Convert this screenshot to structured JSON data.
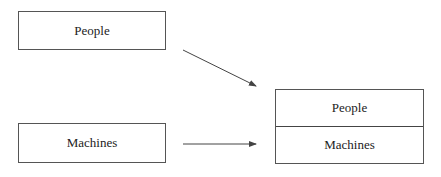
{
  "left_boxes": {
    "people": "People",
    "machines": "Machines"
  },
  "combined_box": {
    "top": "People",
    "bottom": "Machines"
  },
  "colors": {
    "line": "#555555",
    "text": "#222222"
  }
}
